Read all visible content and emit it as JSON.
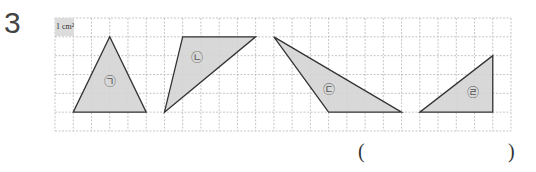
{
  "question": {
    "number": "3",
    "unit_label": "1 cm²"
  },
  "grid": {
    "left": 55,
    "top": 18,
    "cols": 25,
    "rows": 6,
    "cell_w": 18.24,
    "cell_h": 18.83,
    "line_color": "#b8b8b8",
    "fill_color": "#d4d4d4",
    "stroke_color": "#333333"
  },
  "shapes": [
    {
      "label": "㉠",
      "points": [
        [
          1,
          5
        ],
        [
          5,
          5
        ],
        [
          3,
          1
        ]
      ],
      "label_pos": [
        3,
        3.4
      ]
    },
    {
      "label": "㉡",
      "points": [
        [
          7,
          1
        ],
        [
          11,
          1
        ],
        [
          6,
          5
        ]
      ],
      "label_pos": [
        7.8,
        2.1
      ]
    },
    {
      "label": "㉢",
      "points": [
        [
          12,
          1
        ],
        [
          15,
          5
        ],
        [
          19,
          5
        ]
      ],
      "label_pos": [
        15,
        3.8
      ]
    },
    {
      "label": "㉣",
      "points": [
        [
          20,
          5
        ],
        [
          24,
          5
        ],
        [
          24,
          2
        ]
      ],
      "label_pos": [
        22.9,
        4.0
      ]
    }
  ],
  "answer": {
    "open": "(",
    "close": ")",
    "value": ""
  }
}
